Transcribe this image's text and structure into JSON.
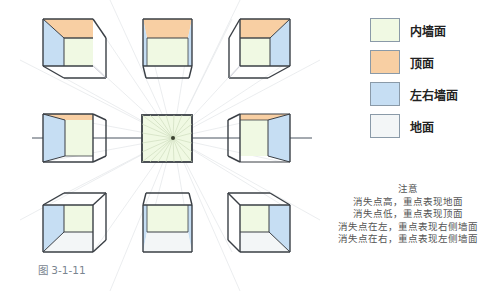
{
  "legend": {
    "items": [
      {
        "label": "内墙面",
        "color": "#f0f9e3"
      },
      {
        "label": "顶面",
        "color": "#f8cfa3"
      },
      {
        "label": "左右墙面",
        "color": "#c6def3"
      },
      {
        "label": "地面",
        "color": "#f3f6f7"
      }
    ]
  },
  "notes": {
    "title": "注意",
    "lines": [
      "消失点高，重点表现地面",
      "消失点低，重点表现顶面",
      "消失点在左，重点表现右侧墙面",
      "消失点在右，重点表现左侧墙面"
    ]
  },
  "caption": "图 3-1-11",
  "colors": {
    "inner_wall": "#f0f9e3",
    "ceiling": "#f8cfa3",
    "side_wall": "#c6def3",
    "floor": "#f3f6f7",
    "edge": "#3a3f45",
    "horizon": "#4a5560",
    "ray": "#e2e6e8"
  }
}
